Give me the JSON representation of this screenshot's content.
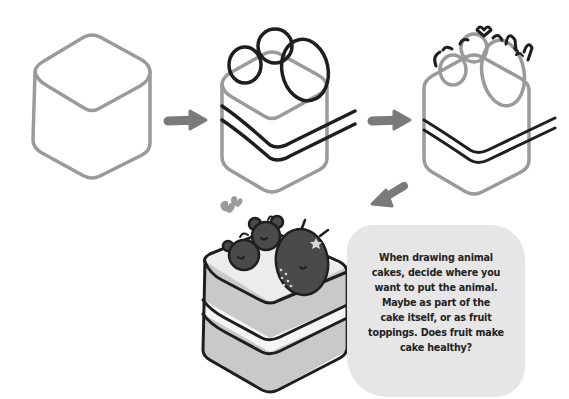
{
  "illustration": {
    "title": "How to draw an animal cake",
    "steps": [
      {
        "step": 1,
        "description": "cube base outline"
      },
      {
        "step": 2,
        "description": "cream layers and fruit circles"
      },
      {
        "step": 3,
        "description": "animal ears and details"
      },
      {
        "step": 4,
        "description": "finished colored animal cake"
      }
    ],
    "colors": {
      "outline_gray": "#9a9a9a",
      "ink": "#1e1e1e",
      "arrow": "#7a7a7a",
      "note_bg": "#e6e6e6",
      "cake_light": "#c9c9c9",
      "cake_top": "#ececec",
      "fruit_dark": "#4a4a4a"
    }
  },
  "note": {
    "lines": [
      "When drawing animal",
      "cakes, decide where you",
      "want to put the animal.",
      "Maybe as part of the",
      "cake itself, or as fruit",
      "toppings. Does fruit make",
      "cake healthy?"
    ]
  }
}
